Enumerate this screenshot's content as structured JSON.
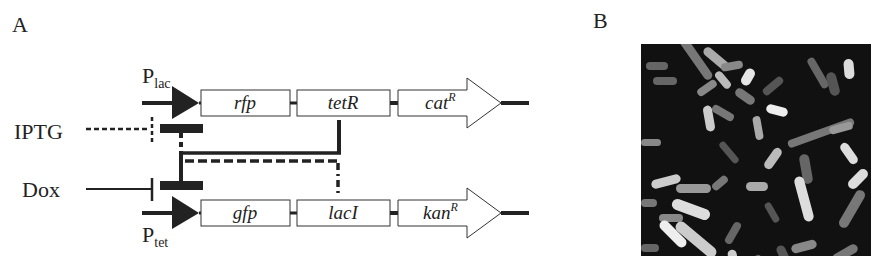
{
  "panels": {
    "a": {
      "label": "A",
      "promoters": {
        "top": {
          "name": "P",
          "sub": "lac"
        },
        "bottom": {
          "name": "P",
          "sub": "tet"
        }
      },
      "inducers": {
        "iptg": "IPTG",
        "dox": "Dox"
      },
      "top_operon": [
        {
          "name": "rfp",
          "sup": ""
        },
        {
          "name": "tetR",
          "sup": ""
        },
        {
          "name": "cat",
          "sup": "R"
        }
      ],
      "bottom_operon": [
        {
          "name": "gfp",
          "sup": ""
        },
        {
          "name": "lacI",
          "sup": ""
        },
        {
          "name": "kan",
          "sup": "R"
        }
      ]
    },
    "b": {
      "label": "B",
      "image_description": "fluorescence micrograph of rod-shaped bacterial cells"
    }
  },
  "colors": {
    "ink": "#222222",
    "background": "#ffffff",
    "micro_bg": "#111111"
  }
}
